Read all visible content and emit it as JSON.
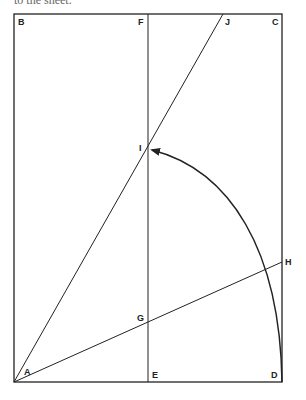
{
  "caption": "to the sheet.",
  "points": {
    "A": {
      "label": "A",
      "x": 14,
      "y": 382
    },
    "B": {
      "label": "B",
      "x": 14,
      "y": 14
    },
    "C": {
      "label": "C",
      "x": 282,
      "y": 14
    },
    "D": {
      "label": "D",
      "x": 282,
      "y": 382
    },
    "E": {
      "label": "E",
      "x": 148,
      "y": 382
    },
    "F": {
      "label": "F",
      "x": 148,
      "y": 14
    },
    "G": {
      "label": "G",
      "x": 148,
      "y": 323
    },
    "H": {
      "label": "H",
      "x": 282,
      "y": 262
    },
    "I": {
      "label": "I",
      "x": 148,
      "y": 148
    },
    "J": {
      "label": "J",
      "x": 223,
      "y": 14
    }
  },
  "colors": {
    "line": "#222222",
    "background": "#ffffff"
  }
}
